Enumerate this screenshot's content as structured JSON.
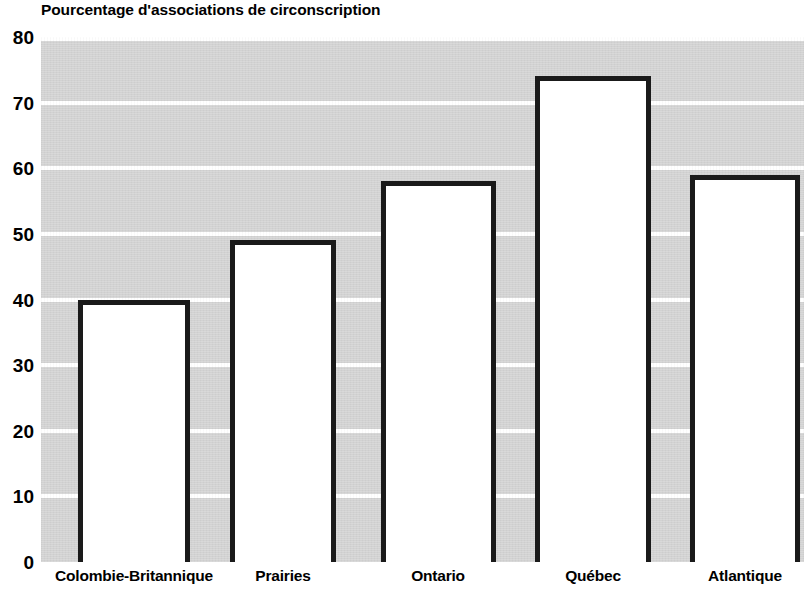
{
  "chart_data": {
    "type": "bar",
    "title": "Pourcentage d'associations de circonscription",
    "xlabel": "",
    "ylabel": "",
    "categories": [
      "Colombie-Britannique",
      "Prairies",
      "Ontario",
      "Québec",
      "Atlantique"
    ],
    "values": [
      40,
      49,
      58,
      74,
      59
    ],
    "ylim": [
      0,
      80
    ],
    "yticks": [
      0,
      10,
      20,
      30,
      40,
      50,
      60,
      70,
      80
    ],
    "ytick_labels": [
      "0",
      "10",
      "20",
      "30",
      "40",
      "50",
      "60",
      "70",
      "80"
    ],
    "grid": true,
    "grid_axis": "y",
    "legend": false,
    "legend_position": "none",
    "bar_style": {
      "fill_color": "#ffffff",
      "edge_color": "#1a1a1a",
      "edge_width_px": 5
    },
    "plot_background_color": "#d2d2d2",
    "gridline_color": "#ffffff",
    "figure_background_color": "#ffffff",
    "text_color": "#000000"
  }
}
